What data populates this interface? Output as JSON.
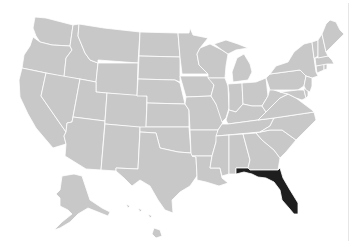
{
  "map": {
    "title": "United States",
    "highlighted_state": "Florida",
    "colors": {
      "default_fill": "#c8c8c8",
      "highlight_fill": "#1e1e1e",
      "border": "#ffffff",
      "background": "#ffffff"
    },
    "states": [
      {
        "id": "WA",
        "name": "Washington",
        "highlighted": false
      },
      {
        "id": "OR",
        "name": "Oregon",
        "highlighted": false
      },
      {
        "id": "CA",
        "name": "California",
        "highlighted": false
      },
      {
        "id": "ID",
        "name": "Idaho",
        "highlighted": false
      },
      {
        "id": "NV",
        "name": "Nevada",
        "highlighted": false
      },
      {
        "id": "MT",
        "name": "Montana",
        "highlighted": false
      },
      {
        "id": "WY",
        "name": "Wyoming",
        "highlighted": false
      },
      {
        "id": "UT",
        "name": "Utah",
        "highlighted": false
      },
      {
        "id": "AZ",
        "name": "Arizona",
        "highlighted": false
      },
      {
        "id": "CO",
        "name": "Colorado",
        "highlighted": false
      },
      {
        "id": "NM",
        "name": "New Mexico",
        "highlighted": false
      },
      {
        "id": "ND",
        "name": "North Dakota",
        "highlighted": false
      },
      {
        "id": "SD",
        "name": "South Dakota",
        "highlighted": false
      },
      {
        "id": "NE",
        "name": "Nebraska",
        "highlighted": false
      },
      {
        "id": "KS",
        "name": "Kansas",
        "highlighted": false
      },
      {
        "id": "OK",
        "name": "Oklahoma",
        "highlighted": false
      },
      {
        "id": "TX",
        "name": "Texas",
        "highlighted": false
      },
      {
        "id": "MN",
        "name": "Minnesota",
        "highlighted": false
      },
      {
        "id": "IA",
        "name": "Iowa",
        "highlighted": false
      },
      {
        "id": "MO",
        "name": "Missouri",
        "highlighted": false
      },
      {
        "id": "AR",
        "name": "Arkansas",
        "highlighted": false
      },
      {
        "id": "LA",
        "name": "Louisiana",
        "highlighted": false
      },
      {
        "id": "WI",
        "name": "Wisconsin",
        "highlighted": false
      },
      {
        "id": "IL",
        "name": "Illinois",
        "highlighted": false
      },
      {
        "id": "MI",
        "name": "Michigan",
        "highlighted": false
      },
      {
        "id": "IN",
        "name": "Indiana",
        "highlighted": false
      },
      {
        "id": "OH",
        "name": "Ohio",
        "highlighted": false
      },
      {
        "id": "KY",
        "name": "Kentucky",
        "highlighted": false
      },
      {
        "id": "TN",
        "name": "Tennessee",
        "highlighted": false
      },
      {
        "id": "MS",
        "name": "Mississippi",
        "highlighted": false
      },
      {
        "id": "AL",
        "name": "Alabama",
        "highlighted": false
      },
      {
        "id": "GA",
        "name": "Georgia",
        "highlighted": false
      },
      {
        "id": "FL",
        "name": "Florida",
        "highlighted": true
      },
      {
        "id": "SC",
        "name": "South Carolina",
        "highlighted": false
      },
      {
        "id": "NC",
        "name": "North Carolina",
        "highlighted": false
      },
      {
        "id": "VA",
        "name": "Virginia",
        "highlighted": false
      },
      {
        "id": "WV",
        "name": "West Virginia",
        "highlighted": false
      },
      {
        "id": "PA",
        "name": "Pennsylvania",
        "highlighted": false
      },
      {
        "id": "NY",
        "name": "New York",
        "highlighted": false
      },
      {
        "id": "MD",
        "name": "Maryland",
        "highlighted": false
      },
      {
        "id": "DE",
        "name": "Delaware",
        "highlighted": false
      },
      {
        "id": "NJ",
        "name": "New Jersey",
        "highlighted": false
      },
      {
        "id": "CT",
        "name": "Connecticut",
        "highlighted": false
      },
      {
        "id": "RI",
        "name": "Rhode Island",
        "highlighted": false
      },
      {
        "id": "MA",
        "name": "Massachusetts",
        "highlighted": false
      },
      {
        "id": "VT",
        "name": "Vermont",
        "highlighted": false
      },
      {
        "id": "NH",
        "name": "New Hampshire",
        "highlighted": false
      },
      {
        "id": "ME",
        "name": "Maine",
        "highlighted": false
      },
      {
        "id": "AK",
        "name": "Alaska",
        "highlighted": false
      },
      {
        "id": "HI",
        "name": "Hawaii",
        "highlighted": false
      }
    ]
  }
}
